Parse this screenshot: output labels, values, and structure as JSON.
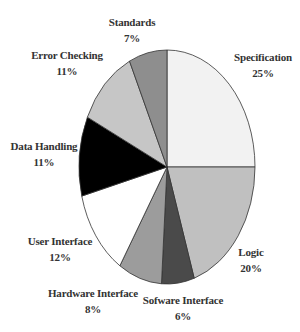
{
  "chart_data": {
    "type": "pie",
    "title": "",
    "start_angle_deg": 0,
    "direction": "clockwise",
    "center": [
      167,
      167
    ],
    "radii": [
      88,
      117
    ],
    "slices": [
      {
        "label": "Specification",
        "value": 25,
        "pct_text": "25%",
        "color": "#f2f2f2",
        "label_pos": [
          263,
          49
        ]
      },
      {
        "label": "Logic",
        "value": 20,
        "pct_text": "20%",
        "color": "#c0c0c0",
        "label_pos": [
          251,
          244
        ]
      },
      {
        "label": "Sofware Interface",
        "value": 6,
        "pct_text": "6%",
        "color": "#4a4a4a",
        "label_pos": [
          183,
          292
        ]
      },
      {
        "label": "Hardware Interface",
        "value": 8,
        "pct_text": "8%",
        "color": "#9c9c9c",
        "label_pos": [
          93,
          285
        ]
      },
      {
        "label": "User Interface",
        "value": 12,
        "pct_text": "12%",
        "color": "#ffffff",
        "label_pos": [
          60,
          233
        ]
      },
      {
        "label": "Data Handling",
        "value": 11,
        "pct_text": "11%",
        "color": "#000000",
        "label_pos": [
          44,
          138
        ]
      },
      {
        "label": "Error Checking",
        "value": 11,
        "pct_text": "11%",
        "color": "#c6c6c6",
        "label_pos": [
          67,
          47
        ]
      },
      {
        "label": "Standards",
        "value": 7,
        "pct_text": "7%",
        "color": "#8e8e8e",
        "label_pos": [
          132,
          14
        ]
      }
    ],
    "categories": [
      "Specification",
      "Logic",
      "Sofware Interface",
      "Hardware Interface",
      "User Interface",
      "Data Handling",
      "Error Checking",
      "Standards"
    ],
    "values": [
      25,
      20,
      6,
      8,
      12,
      11,
      11,
      7
    ],
    "legend": "none",
    "outline_color": "#333333"
  }
}
